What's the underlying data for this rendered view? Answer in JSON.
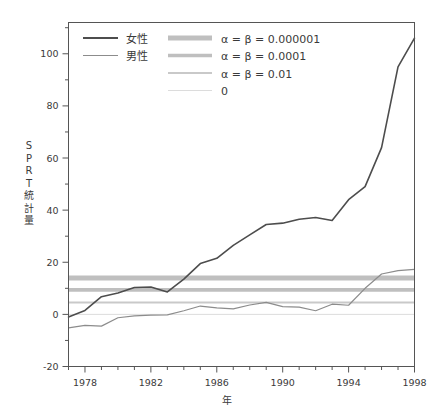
{
  "chart_data": {
    "type": "line",
    "title": "",
    "xlabel": "年",
    "ylabel": "SPRT統計量",
    "ylabel_chars": [
      "S",
      "P",
      "R",
      "T",
      "統",
      "計",
      "量"
    ],
    "xlim": [
      1977,
      1998
    ],
    "ylim": [
      -20,
      112
    ],
    "yticks": [
      -20,
      0,
      20,
      40,
      60,
      80,
      100
    ],
    "ytick_labels": [
      "-20",
      "0",
      "20",
      "40",
      "60",
      "80",
      "100"
    ],
    "y_minor_tick_step": 10,
    "xticks": [
      1978,
      1982,
      1986,
      1990,
      1994,
      1998
    ],
    "xtick_labels": [
      "1978",
      "1982",
      "1986",
      "1990",
      "1994",
      "1998"
    ],
    "x_minor_tick_step": 1,
    "grid": false,
    "legend_position": "top-left",
    "x": [
      1977,
      1978,
      1979,
      1980,
      1981,
      1982,
      1983,
      1984,
      1985,
      1986,
      1987,
      1988,
      1989,
      1990,
      1991,
      1992,
      1993,
      1994,
      1995,
      1996,
      1997,
      1998
    ],
    "series": [
      {
        "name": "女性",
        "color": "#4d4d4d",
        "width": 1.6,
        "values": [
          -1.0,
          1.5,
          6.8,
          8.2,
          10.3,
          10.5,
          8.6,
          13.5,
          19.5,
          21.5,
          26.5,
          30.5,
          34.5,
          35.0,
          36.5,
          37.2,
          36.0,
          44.0,
          49.0,
          64.0,
          95.0,
          106.0
        ]
      },
      {
        "name": "男性",
        "color": "#8c8c8c",
        "width": 1.2,
        "values": [
          -5.2,
          -4.2,
          -4.5,
          -1.3,
          -0.6,
          -0.3,
          -0.2,
          1.4,
          3.2,
          2.5,
          2.1,
          3.6,
          4.6,
          3.0,
          2.8,
          1.4,
          3.9,
          3.5,
          10.0,
          15.5,
          16.8,
          17.3
        ]
      }
    ],
    "threshold_lines": [
      {
        "label": "α = β = 0.000001",
        "value": 14.0,
        "color": "#bfbfbf",
        "width": 5.0
      },
      {
        "label": "α = β = 0.0001",
        "value": 9.4,
        "color": "#bfbfbf",
        "width": 3.6
      },
      {
        "label": "α = β = 0.01",
        "value": 4.6,
        "color": "#c9c9c9",
        "width": 2.0
      },
      {
        "label": "0",
        "value": 0.0,
        "color": "#dcdcdc",
        "width": 1.0
      }
    ],
    "legend_series": [
      {
        "label": "女性",
        "color": "#4d4d4d",
        "width": 1.8
      },
      {
        "label": "男性",
        "color": "#8c8c8c",
        "width": 1.2
      }
    ],
    "legend_thresholds": [
      {
        "label": "α = β = 0.000001",
        "color": "#bfbfbf",
        "width": 5.0
      },
      {
        "label": "α = β = 0.0001",
        "color": "#bfbfbf",
        "width": 3.6
      },
      {
        "label": "α = β = 0.01",
        "color": "#c9c9c9",
        "width": 2.0
      },
      {
        "label": "0",
        "color": "#dcdcdc",
        "width": 1.0
      }
    ],
    "frame_color": "#555555",
    "background": "#ffffff"
  }
}
